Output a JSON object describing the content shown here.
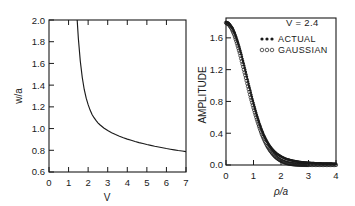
{
  "figure": {
    "title": "",
    "panel_count": 2
  },
  "chart_data": [
    {
      "id": "left",
      "type": "line",
      "title": "",
      "xlabel": "V",
      "ylabel": "w/a",
      "xlim": [
        0,
        7
      ],
      "ylim": [
        0.6,
        2.0
      ],
      "xticks": [
        0,
        1,
        2,
        3,
        4,
        5,
        6,
        7
      ],
      "xticklabels": [
        "0",
        "1",
        "2",
        "3",
        "4",
        "5",
        "6",
        "7"
      ],
      "yticks": [
        0.6,
        0.8,
        1.0,
        1.2,
        1.4,
        1.6,
        1.8,
        2.0
      ],
      "yticklabels": [
        "0.6",
        "0.8",
        "1.0",
        "1.2",
        "1.4",
        "1.6",
        "1.8",
        "2.0"
      ],
      "grid": false,
      "legend": null,
      "series": [
        {
          "name": "spot size",
          "x": [
            1.44,
            1.5,
            1.6,
            1.7,
            1.8,
            1.9,
            2.0,
            2.1,
            2.2,
            2.3,
            2.4,
            2.5,
            2.6,
            2.8,
            3.0,
            3.2,
            3.4,
            3.6,
            3.8,
            4.0,
            4.2,
            4.4,
            4.6,
            4.8,
            5.0,
            5.2,
            5.4,
            5.6,
            5.8,
            6.0,
            6.2,
            6.4,
            6.6,
            6.8,
            7.0
          ],
          "y": [
            2.0,
            1.83,
            1.62,
            1.47,
            1.36,
            1.28,
            1.22,
            1.17,
            1.13,
            1.1,
            1.075,
            1.053,
            1.035,
            1.005,
            0.982,
            0.962,
            0.945,
            0.93,
            0.916,
            0.903,
            0.892,
            0.881,
            0.871,
            0.862,
            0.853,
            0.845,
            0.837,
            0.83,
            0.823,
            0.816,
            0.81,
            0.804,
            0.798,
            0.793,
            0.788
          ]
        }
      ]
    },
    {
      "id": "right",
      "type": "scatter",
      "title": "",
      "xlabel": "ρ/a",
      "ylabel": "AMPLITUDE",
      "xlim": [
        0,
        4
      ],
      "ylim": [
        0.0,
        1.85
      ],
      "xticks": [
        0,
        1,
        2,
        3,
        4
      ],
      "xticklabels": [
        "0",
        "1",
        "2",
        "3",
        "4"
      ],
      "yticks": [
        0.0,
        0.4,
        0.8,
        1.2,
        1.6
      ],
      "yticklabels": [
        "0.0",
        "0.4",
        "0.8",
        "1.2",
        "1.6"
      ],
      "grid": false,
      "annotation": "V = 2.4",
      "legend_position": "top-right",
      "legend": [
        {
          "label": "ACTUAL",
          "marker": "filled-dot"
        },
        {
          "label": "GAUSSIAN",
          "marker": "open-circle"
        }
      ],
      "series": [
        {
          "name": "ACTUAL",
          "marker": "filled-dot",
          "x": [
            0.0,
            0.08,
            0.16,
            0.24,
            0.32,
            0.4,
            0.48,
            0.56,
            0.64,
            0.72,
            0.8,
            0.88,
            0.96,
            1.04,
            1.12,
            1.2,
            1.28,
            1.36,
            1.44,
            1.52,
            1.6,
            1.68,
            1.76,
            1.84,
            1.92,
            2.0,
            2.1,
            2.2,
            2.3,
            2.4,
            2.5,
            2.6,
            2.7,
            2.8,
            2.9,
            3.0,
            3.1,
            3.2,
            3.3,
            3.4,
            3.5,
            3.6,
            3.7,
            3.8,
            3.9,
            4.0
          ],
          "y": [
            1.8,
            1.79,
            1.76,
            1.72,
            1.66,
            1.58,
            1.49,
            1.39,
            1.28,
            1.17,
            1.05,
            0.94,
            0.83,
            0.73,
            0.63,
            0.54,
            0.46,
            0.39,
            0.33,
            0.28,
            0.235,
            0.2,
            0.17,
            0.145,
            0.125,
            0.108,
            0.09,
            0.076,
            0.065,
            0.056,
            0.049,
            0.043,
            0.038,
            0.034,
            0.031,
            0.028,
            0.026,
            0.024,
            0.022,
            0.021,
            0.02,
            0.019,
            0.018,
            0.018,
            0.017,
            0.017
          ]
        },
        {
          "name": "GAUSSIAN",
          "marker": "open-circle",
          "x": [
            0.0,
            0.1,
            0.2,
            0.3,
            0.4,
            0.5,
            0.6,
            0.7,
            0.8,
            0.9,
            1.0,
            1.1,
            1.2,
            1.3,
            1.4,
            1.5,
            1.6,
            1.7,
            1.8,
            1.9,
            2.0,
            2.1,
            2.2,
            2.3,
            2.4,
            2.5,
            2.6,
            2.7,
            2.8,
            2.9,
            3.0,
            3.2,
            3.4,
            3.6,
            3.8,
            4.0
          ],
          "y": [
            1.79,
            1.77,
            1.72,
            1.64,
            1.53,
            1.41,
            1.27,
            1.13,
            0.99,
            0.85,
            0.72,
            0.6,
            0.49,
            0.39,
            0.31,
            0.24,
            0.185,
            0.14,
            0.103,
            0.075,
            0.054,
            0.038,
            0.026,
            0.018,
            0.012,
            0.008,
            0.005,
            0.003,
            0.002,
            0.0015,
            0.001,
            0.0008,
            0.0006,
            0.0005,
            0.0004,
            0.0004
          ]
        }
      ]
    }
  ]
}
